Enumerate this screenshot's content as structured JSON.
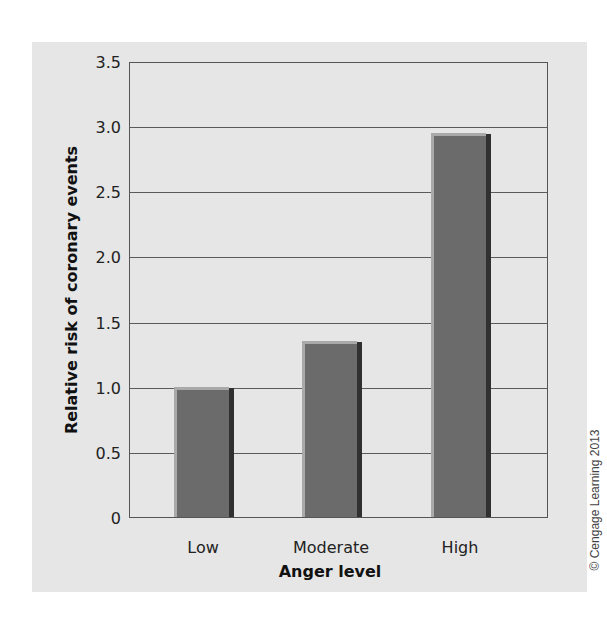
{
  "chart_data": {
    "type": "bar",
    "title": "",
    "categories": [
      "Low",
      "Moderate",
      "High"
    ],
    "values": [
      1.0,
      1.35,
      2.95
    ],
    "xlabel": "Anger level",
    "ylabel": "Relative risk of coronary events",
    "ylim": [
      0,
      3.5
    ],
    "yticks": [
      "0",
      "0.5",
      "1.0",
      "1.5",
      "2.0",
      "2.5",
      "3.0",
      "3.5"
    ],
    "grid": true,
    "legend": null,
    "bar_color": "#6b6b6b"
  },
  "credit": "© Cengage Learning 2013"
}
